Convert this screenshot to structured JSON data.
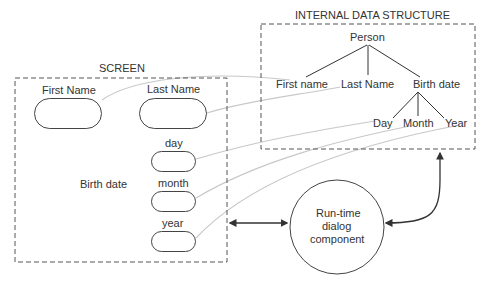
{
  "screen": {
    "title": "SCREEN",
    "fields": {
      "first_name": "First Name",
      "last_name": "Last Name",
      "birth_date": "Birth date",
      "day": "day",
      "month": "month",
      "year": "year"
    }
  },
  "internal": {
    "title": "INTERNAL DATA STRUCTURE",
    "root": "Person",
    "children": [
      "First name",
      "Last Name",
      "Birth date"
    ],
    "birth_children": [
      "Day",
      "Month",
      "Year"
    ]
  },
  "dialog": {
    "line1": "Run-time",
    "line2": "dialog",
    "line3": "component"
  },
  "colors": {
    "stroke": "#444444",
    "mapping_line": "#c8c8c8",
    "text": "#333333"
  }
}
